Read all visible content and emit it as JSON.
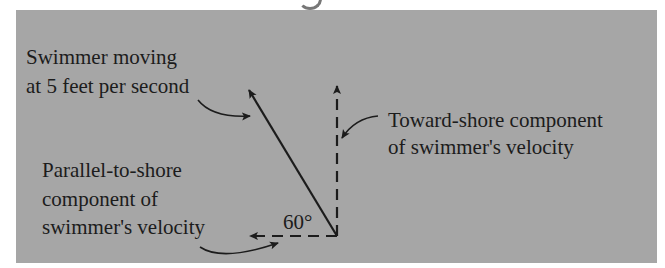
{
  "diagram": {
    "labels": {
      "swimmer_line1": "Swimmer moving",
      "swimmer_line2": "at 5 feet per second",
      "toward_line1": "Toward-shore component",
      "toward_line2": "of swimmer's velocity",
      "parallel_line1": "Parallel-to-shore",
      "parallel_line2": "component of",
      "parallel_line3": "swimmer's velocity",
      "angle": "60°"
    },
    "vectors": [
      {
        "name": "swimmer-velocity",
        "style": "solid",
        "magnitude": "5 feet per second"
      },
      {
        "name": "toward-shore-component",
        "style": "dashed"
      },
      {
        "name": "parallel-to-shore-component",
        "style": "dashed"
      }
    ],
    "colors": {
      "panel": "#a6a6a6",
      "ink": "#1c1c1c"
    }
  }
}
